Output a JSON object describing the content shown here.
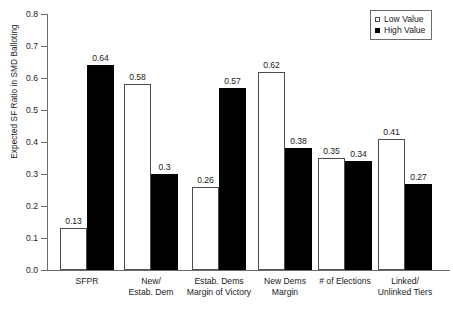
{
  "chart_data": {
    "type": "bar",
    "title": "",
    "xlabel": "",
    "ylabel": "Expected SF Ratio in SMD Balloting",
    "ylim": [
      0.0,
      0.8
    ],
    "ytick_labels": [
      "0.8",
      "0.7",
      "0.6",
      "0.5",
      "0.4",
      "0.3",
      "0.2",
      "0.1",
      "0.0"
    ],
    "ytick_values": [
      0.8,
      0.7,
      0.6,
      0.5,
      0.4,
      0.3,
      0.2,
      0.1,
      0.0
    ],
    "grid": false,
    "legend_position": "top-right",
    "categories": [
      "SFPR",
      "New/ Estab. Dem",
      "Estab. Dems Margin of Victory",
      "New Dems Margin",
      "# of Elections",
      "Linked/ Unlinked Tiers"
    ],
    "category_lines": [
      [
        "SFPR"
      ],
      [
        "New/",
        "Estab. Dem"
      ],
      [
        "Estab. Dems",
        "Margin of Victory"
      ],
      [
        "New Dems",
        "Margin"
      ],
      [
        "# of Elections"
      ],
      [
        "Linked/",
        "Unlinked Tiers"
      ]
    ],
    "series": [
      {
        "name": "Low Value",
        "color": "#ffffff",
        "edge_color": "#4d4d4d",
        "values": [
          0.13,
          0.58,
          0.26,
          0.62,
          0.35,
          0.41
        ],
        "labels": [
          "0.13",
          "0.58",
          "0.26",
          "0.62",
          "0.35",
          "0.41"
        ]
      },
      {
        "name": "High Value",
        "color": "#000000",
        "edge_color": "#000000",
        "values": [
          0.64,
          0.3,
          0.57,
          0.38,
          0.34,
          0.27
        ],
        "labels": [
          "0.64",
          "0.3",
          "0.57",
          "0.38",
          "0.34",
          "0.27"
        ]
      }
    ]
  },
  "legend": {
    "items": [
      {
        "label": "Low Value",
        "swatch": "open-square"
      },
      {
        "label": "High Value",
        "swatch": "filled-square"
      }
    ]
  }
}
